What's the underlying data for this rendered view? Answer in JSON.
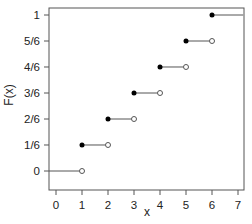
{
  "chart_data": {
    "type": "line",
    "subtype": "step (empirical CDF)",
    "title": "",
    "xlabel": "x",
    "ylabel": "F(x)",
    "xlim": [
      -0.3,
      7.2
    ],
    "ylim": [
      -0.05,
      1.05
    ],
    "x_ticks": [
      0,
      1,
      2,
      3,
      4,
      5,
      6,
      7
    ],
    "x_tick_labels": [
      "0",
      "1",
      "2",
      "3",
      "4",
      "5",
      "6",
      "7"
    ],
    "y_ticks": [
      0,
      0.1667,
      0.3333,
      0.5,
      0.6667,
      0.8333,
      1
    ],
    "y_tick_labels": [
      "0",
      "1/6",
      "2/6",
      "3/6",
      "4/6",
      "5/6",
      "1"
    ],
    "grid": false,
    "legend": null,
    "segments": [
      {
        "x_start": -0.3,
        "x_end": 1,
        "y": 0,
        "closed_start": false,
        "open_end": true
      },
      {
        "x_start": 1,
        "x_end": 2,
        "y": 0.1667,
        "closed_start": true,
        "open_end": true
      },
      {
        "x_start": 2,
        "x_end": 3,
        "y": 0.3333,
        "closed_start": true,
        "open_end": true
      },
      {
        "x_start": 3,
        "x_end": 4,
        "y": 0.5,
        "closed_start": true,
        "open_end": true
      },
      {
        "x_start": 4,
        "x_end": 5,
        "y": 0.6667,
        "closed_start": true,
        "open_end": true
      },
      {
        "x_start": 5,
        "x_end": 6,
        "y": 0.8333,
        "closed_start": true,
        "open_end": true
      },
      {
        "x_start": 6,
        "x_end": 7.2,
        "y": 1,
        "closed_start": true,
        "open_end": false
      }
    ]
  },
  "colors": {
    "line": "#555555",
    "point_filled": "#000000",
    "axis": "#555555",
    "text": "#222222"
  }
}
